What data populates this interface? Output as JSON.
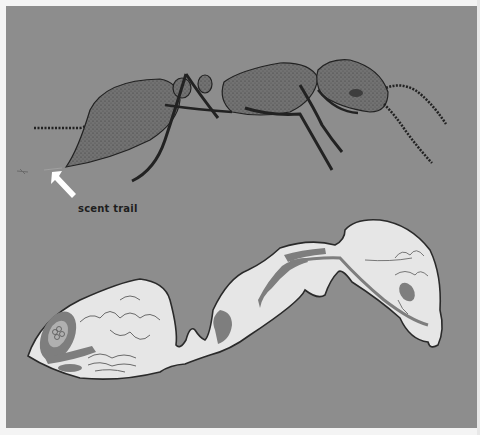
{
  "figure": {
    "top_illustration": {
      "subject": "ant side view",
      "annotation": {
        "label": "scent trail",
        "arrow": "white-arrow-pointing-up-left"
      }
    },
    "bottom_illustration": {
      "subject": "ant internal anatomy cross-section"
    },
    "colors": {
      "background": "#8d8d8d",
      "body_fill": "#6f6f6f",
      "section_fill": "#e6e6e6",
      "organ_fill": "#7e7e7e",
      "outline": "#2a2a2a",
      "arrow": "#ffffff",
      "frame": "#f4f4f4"
    }
  }
}
